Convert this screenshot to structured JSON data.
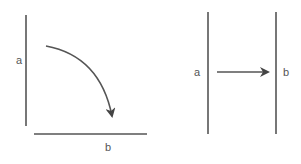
{
  "left_figure": {
    "label_a": "a",
    "label_b": "b",
    "arrow": "curved-arrow"
  },
  "right_figure": {
    "label_a": "a",
    "label_b": "b",
    "arrow": "straight-arrow"
  },
  "colors": {
    "line": "#555555",
    "text": "#555555"
  }
}
